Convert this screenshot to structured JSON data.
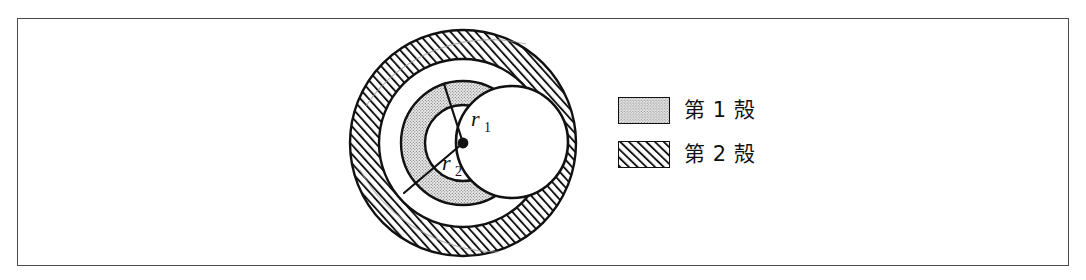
{
  "figure": {
    "kind": "electron-shell-diagram",
    "background_color": "#ffffff",
    "frame_border_color": "#4a4a4a",
    "ink_color": "#111111"
  },
  "diagram": {
    "center_label": "nucleus-dot",
    "radius_labels": [
      {
        "id": "r1",
        "base": "r",
        "sub": "1",
        "x": 146,
        "y": 102
      },
      {
        "id": "r2",
        "base": "r",
        "sub": "2",
        "x": 118,
        "y": 146
      }
    ],
    "shells": [
      {
        "name": "first-shell",
        "legend_key": "第 1 殻",
        "fill_pattern": "dotted",
        "fill_color": "#e8e8e8",
        "dot_color": "#6b6b6b",
        "inner_radius": 38,
        "outer_radius": 62
      },
      {
        "name": "second-shell",
        "legend_key": "第 2 殻",
        "fill_pattern": "diagonal-hatch",
        "fill_color": "#ffffff",
        "hatch_color": "#111111",
        "inner_radius": 84,
        "outer_radius": 113
      }
    ],
    "lobe": {
      "name": "cut-away-lobe",
      "description": "white spherical lobe cutting through the shells on the right",
      "cx": 182,
      "cy": 122,
      "r": 56
    }
  },
  "legend": {
    "items": [
      {
        "id": "shell-1",
        "pattern": "dotted",
        "label": "第 1 殻"
      },
      {
        "id": "shell-2",
        "pattern": "diagonal-hatch",
        "label": "第 2 殻"
      }
    ]
  }
}
